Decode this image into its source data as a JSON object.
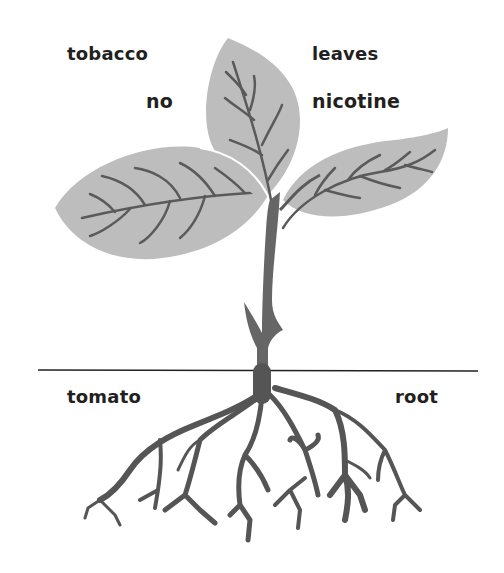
{
  "diagram": {
    "type": "grafted-plant-illustration",
    "labels": {
      "top_left": "tobacco",
      "top_right": "leaves",
      "mid_left": "no",
      "mid_right": "nicotine",
      "bottom_left": "tomato",
      "bottom_right": "root"
    },
    "colors": {
      "leaf_fill": "#bdbdbd",
      "vein_stroke": "#5a5a5a",
      "stem_fill": "#666666",
      "root_fill": "#555555",
      "ground_line": "#222222",
      "text": "#231f20",
      "background": "#ffffff"
    }
  }
}
